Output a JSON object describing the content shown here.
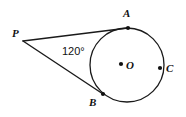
{
  "figure": {
    "background_color": "#ffffff",
    "stroke_color": "#1a1a1a",
    "point_color": "#111111",
    "label_color": "#111111",
    "width": 186,
    "height": 117
  },
  "labels": {
    "p": "P",
    "a": "A",
    "b": "B",
    "c": "C",
    "o": "O",
    "angle": "120°"
  },
  "geometry": {
    "circle": {
      "cx": 127,
      "cy": 65,
      "r": 37,
      "stroke_width": 1.3
    },
    "points": {
      "P": {
        "x": 23,
        "y": 41,
        "dot": false,
        "label_x": 12,
        "label_y": 37
      },
      "A": {
        "x": 128,
        "y": 28,
        "dot": true,
        "label_x": 123,
        "label_y": 17
      },
      "B": {
        "x": 103,
        "y": 94,
        "dot": true,
        "label_x": 89,
        "label_y": 106
      },
      "C": {
        "x": 160,
        "y": 68,
        "dot": true,
        "label_x": 166,
        "label_y": 72
      },
      "O": {
        "x": 121,
        "y": 64,
        "dot": true,
        "label_x": 126,
        "label_y": 69
      }
    },
    "tangent_lines": [
      {
        "name": "PA",
        "x1": 23,
        "y1": 41,
        "x2": 128,
        "y2": 28
      },
      {
        "name": "PB",
        "x1": 23,
        "y1": 41,
        "x2": 103,
        "y2": 94
      }
    ],
    "angle_label_position": {
      "x": 62,
      "y": 55
    },
    "dot_radius": 2.1
  }
}
